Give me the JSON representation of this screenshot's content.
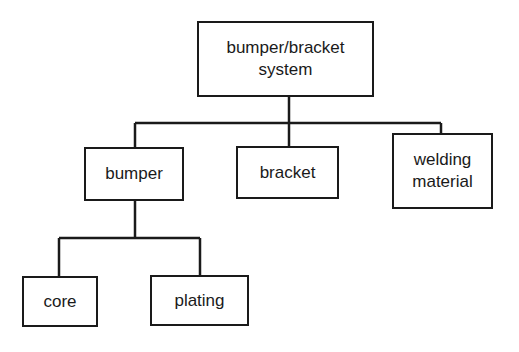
{
  "diagram": {
    "type": "tree",
    "nodes": {
      "root": {
        "label": "bumper/bracket\nsystem"
      },
      "bumper": {
        "label": "bumper"
      },
      "bracket": {
        "label": "bracket"
      },
      "welding": {
        "label": "welding\nmaterial"
      },
      "core": {
        "label": "core"
      },
      "plating": {
        "label": "plating"
      }
    },
    "edges": [
      [
        "root",
        "bumper"
      ],
      [
        "root",
        "bracket"
      ],
      [
        "root",
        "welding"
      ],
      [
        "bumper",
        "core"
      ],
      [
        "bumper",
        "plating"
      ]
    ],
    "line_color": "#1a1a1a"
  }
}
